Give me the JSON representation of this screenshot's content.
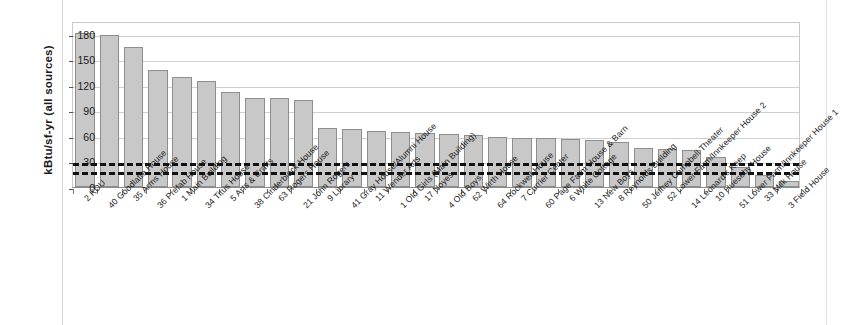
{
  "chart_data": {
    "type": "bar",
    "title": "",
    "xlabel": "",
    "ylabel": "kBtu/sf-yr (all sources)",
    "ylim": [
      0,
      195
    ],
    "yticks": [
      0,
      30,
      60,
      90,
      120,
      150,
      180
    ],
    "grid": true,
    "legend": "none",
    "categories": [
      "2 KDU",
      "40 Goodlatte House",
      "35 Arms House",
      "36 Prefab House",
      "1 Main Building",
      "34 Titus House",
      "5 Arts & Crafts",
      "38 Cinderblock House",
      "63 Rogers House",
      "21 John Rogers",
      "9 Library",
      "41 Gray House/Alumni House",
      "11 Wender Arts",
      "1 Old Girls (Main Building)",
      "17 Noyes",
      "4 Old Boys",
      "62 Wirth House",
      "64 Rockwell House",
      "7 Currier Center",
      "60 Page Farm House & Barn",
      "6 White Cottage",
      "13 New Boys",
      "8 Reynolds Building",
      "50 Jeffrey Campbell Theater",
      "52 Lower Farm/Innkeeper House 2",
      "14 Leonard's Keep",
      "10 Hueseby House",
      "51 Lower Farm/Innkeeper House 1",
      "33 Milk House",
      "3 Field House"
    ],
    "values": [
      181,
      178,
      164,
      137,
      129,
      124,
      112,
      105,
      104,
      102,
      69,
      68,
      66,
      65,
      63,
      62,
      61,
      59,
      58,
      57,
      56,
      55,
      53,
      46,
      45,
      44,
      35,
      24,
      14,
      7
    ],
    "series": [
      {
        "name": "kBtu/sf-yr (all sources)",
        "values": [
          181,
          178,
          164,
          137,
          129,
          124,
          112,
          105,
          104,
          102,
          69,
          68,
          66,
          65,
          63,
          62,
          61,
          59,
          58,
          57,
          56,
          55,
          53,
          46,
          45,
          44,
          35,
          24,
          14,
          7
        ]
      }
    ],
    "reference_lines": [
      {
        "name": "upper-benchmark",
        "value": 31,
        "style": "dashed",
        "color": "#111111"
      },
      {
        "name": "lower-benchmark",
        "value": 20,
        "style": "dashed",
        "color": "#111111"
      }
    ],
    "colors": {
      "bar_fill": "#c8c8c8",
      "bar_border": "#8e8e8e",
      "gridline": "#cfcfcf",
      "axis": "#8a8a8a",
      "text": "#1a1a1a"
    }
  }
}
